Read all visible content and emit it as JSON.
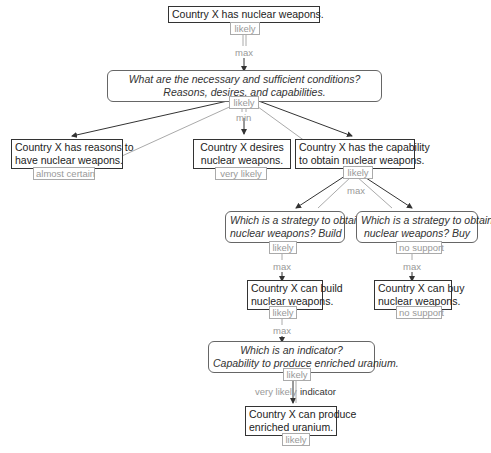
{
  "colors": {
    "claim_border": "#333333",
    "question_border": "#666666",
    "badge": "#999999",
    "edge_dark": "#333333",
    "edge_light": "#aaaaaa"
  },
  "nodes": {
    "root": {
      "text": "Country X has nuclear weapons.",
      "rating": "likely"
    },
    "q_conditions": {
      "line1": "What are the necessary and sufficient conditions?",
      "line2": "Reasons, desires, and capabilities.",
      "rating": "likely"
    },
    "reasons": {
      "line1": "Country X has reasons to",
      "line2": "have nuclear weapons.",
      "rating": "almost certain"
    },
    "desires": {
      "line1": "Country X desires",
      "line2": "nuclear weapons.",
      "rating": "very likely"
    },
    "capability": {
      "line1": "Country X has the capability",
      "line2": "to obtain nuclear weapons.",
      "rating": "likely"
    },
    "q_build": {
      "line1": "Which is a strategy to obtain",
      "line2": "nuclear weapons? Build",
      "rating": "likely"
    },
    "q_buy": {
      "line1": "Which is a strategy to obtain",
      "line2": "nuclear weapons? Buy",
      "rating": "no support"
    },
    "can_build": {
      "line1": "Country X can build",
      "line2": "nuclear weapons.",
      "rating": "likely"
    },
    "can_buy": {
      "line1": "Country X can buy",
      "line2": "nuclear weapons.",
      "rating": "no support"
    },
    "q_indicator": {
      "line1": "Which is an indicator?",
      "line2": "Capability to produce enriched uranium.",
      "rating": "likely"
    },
    "enriched": {
      "line1": "Country X can produce",
      "line2": "enriched uranium.",
      "rating": "likely"
    }
  },
  "edge_labels": {
    "root_max": "max",
    "conditions_min": "min",
    "capability_max": "max",
    "build_max": "max",
    "buy_max": "max",
    "can_build_max": "max",
    "indicator_strength": "very likely",
    "indicator_type": "indicator"
  }
}
